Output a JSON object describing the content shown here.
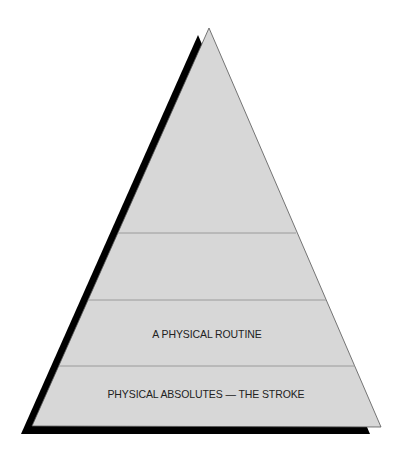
{
  "diagram": {
    "type": "pyramid",
    "colors": {
      "fill": "#d7d7d7",
      "outline": "#555555",
      "divider": "#9a9a9a",
      "shadow": "#000000",
      "text": "#222222"
    },
    "tiers": [
      {
        "position": "top",
        "label": ""
      },
      {
        "position": "upper-middle",
        "label": ""
      },
      {
        "position": "lower-middle",
        "label": "A PHYSICAL ROUTINE"
      },
      {
        "position": "base",
        "label": "PHYSICAL ABSOLUTES — THE STROKE"
      }
    ]
  }
}
